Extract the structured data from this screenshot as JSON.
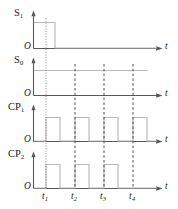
{
  "figure": {
    "type": "timing-diagram",
    "background_color": "#ffffff",
    "wave_color": "#b9b9bb",
    "axis_color": "#58585a",
    "guide_color": "#3b3b3d",
    "text_color": "#231f20",
    "width": 178,
    "height": 209
  },
  "axis": {
    "time_label": "t",
    "origin_label": "O"
  },
  "ticks": [
    {
      "name": "t1",
      "label": "t",
      "sub": "1",
      "x": 46
    },
    {
      "name": "t2",
      "label": "t",
      "sub": "2",
      "x": 75
    },
    {
      "name": "t3",
      "label": "t",
      "sub": "3",
      "x": 104
    },
    {
      "name": "t4",
      "label": "t",
      "sub": "4",
      "x": 133
    }
  ],
  "signals": [
    {
      "name": "S1",
      "label": "S",
      "sub": "1",
      "origin_label": "O",
      "time_label": "t",
      "description": "high from start, falls low just after t1, stays low",
      "levels": [
        {
          "t": 0,
          "value": 1
        },
        {
          "t": 55,
          "value": 0
        }
      ]
    },
    {
      "name": "S0",
      "label": "S",
      "sub": "0",
      "origin_label": "O",
      "time_label": "t",
      "description": "constant high across the whole interval",
      "levels": [
        {
          "t": 0,
          "value": 1
        }
      ]
    },
    {
      "name": "CP1",
      "label": "CP",
      "sub": "1",
      "origin_label": "O",
      "time_label": "t",
      "description": "four clock pulses rising at t1, t2, t3, t4",
      "pulses": [
        {
          "rise": 46,
          "fall": 60
        },
        {
          "rise": 75,
          "fall": 89
        },
        {
          "rise": 104,
          "fall": 118
        },
        {
          "rise": 133,
          "fall": 147
        }
      ]
    },
    {
      "name": "CP2",
      "label": "CP",
      "sub": "2",
      "origin_label": "O",
      "time_label": "t",
      "description": "three clock pulses rising at t1, t2, t3; no pulse at t4",
      "pulses": [
        {
          "rise": 46,
          "fall": 60
        },
        {
          "rise": 75,
          "fall": 89
        },
        {
          "rise": 104,
          "fall": 118
        }
      ]
    }
  ]
}
